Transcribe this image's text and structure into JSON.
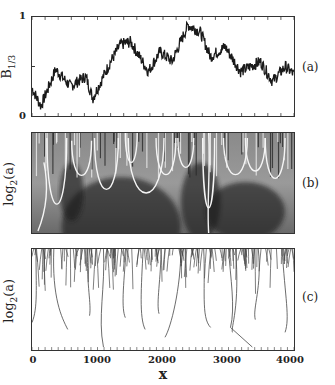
{
  "figure": {
    "panel_tags": [
      "(a)",
      "(b)",
      "(c)"
    ],
    "xlabel": "x",
    "xticks": [
      "0",
      "1000",
      "2000",
      "3000",
      "4000"
    ],
    "panel_a": {
      "ylabel_main": "B",
      "ylabel_sub": "1/3",
      "yticks": [
        "0",
        "1"
      ]
    },
    "panel_b": {
      "ylabel_main": "log",
      "ylabel_sub": "2",
      "ylabel_tail": "(a)"
    },
    "panel_c": {
      "ylabel_main": "log",
      "ylabel_sub": "2",
      "ylabel_tail": "(a)"
    }
  },
  "chart_data": [
    {
      "type": "line",
      "panel": "(a)",
      "title": "",
      "xlabel": "x",
      "ylabel": "B_1/3",
      "xlim": [
        0,
        4096
      ],
      "ylim": [
        0,
        1
      ],
      "yticks": [
        0,
        1
      ],
      "x": [
        0,
        140,
        370,
        600,
        840,
        950,
        1230,
        1380,
        1540,
        1820,
        2000,
        2190,
        2440,
        2630,
        2790,
        3020,
        3260,
        3570,
        3760,
        3960,
        4096
      ],
      "series": [
        {
          "name": "B_1/3",
          "values": [
            0.28,
            0.1,
            0.47,
            0.3,
            0.4,
            0.18,
            0.55,
            0.72,
            0.75,
            0.45,
            0.65,
            0.55,
            0.92,
            0.85,
            0.6,
            0.7,
            0.45,
            0.55,
            0.35,
            0.5,
            0.42
          ]
        }
      ],
      "grid": false
    },
    {
      "type": "heatmap",
      "panel": "(b)",
      "title": "",
      "xlabel": "x",
      "ylabel": "log2(a)",
      "xlim": [
        0,
        4096
      ],
      "description": "Grayscale wavelet transform modulus with white maxima lines forming cone-shaped structures; dark regions near x≈1000-1300 at large scales"
    },
    {
      "type": "line",
      "panel": "(c)",
      "title": "",
      "xlabel": "x",
      "ylabel": "log2(a)",
      "xlim": [
        0,
        4096
      ],
      "xticks": [
        0,
        1000,
        2000,
        3000,
        4000
      ],
      "description": "Skeleton of wavelet transform modulus maxima lines; dense at small scales (top), long lines extending to large scales near x≈0, 350, 1100, 1700, 2100, 2800, 3200-3500, 3900"
    }
  ]
}
